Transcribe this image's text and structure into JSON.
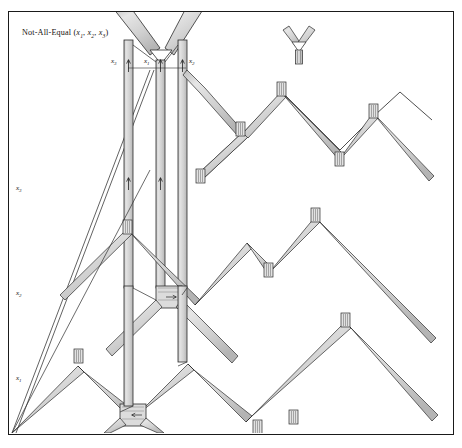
{
  "figure": {
    "title_prefix": "Not-All-Equal",
    "title_args": "(x1, x2, x3)",
    "title_full": "Not-All-Equal (x1, x2, x3)",
    "border_color": "#1a1a1a",
    "background_color": "#ffffff",
    "wire_fill_color": "#d7d7d7",
    "wire_stroke_color": "#2b2b2b",
    "label_color": "#15120f"
  },
  "labels": {
    "top_wires": [
      {
        "name": "x3",
        "base": "x",
        "sub": "3"
      },
      {
        "name": "x1",
        "base": "x",
        "sub": "1"
      },
      {
        "name": "x2",
        "base": "x",
        "sub": "2"
      }
    ],
    "left_wires": [
      {
        "name": "x3",
        "base": "x",
        "sub": "3"
      },
      {
        "name": "x2",
        "base": "x",
        "sub": "2"
      },
      {
        "name": "x1",
        "base": "x",
        "sub": "1"
      }
    ]
  },
  "components": {
    "nae_gadget_label": "not-all-equal-gadget",
    "y_junction_label": "y-junction",
    "zigzag_chain_label": "zigzag-wire-chain",
    "ribbon_wire_label": "ribbon-wire",
    "clamp_label": "clamp-marker",
    "arrow_label": "direction-arrow"
  }
}
